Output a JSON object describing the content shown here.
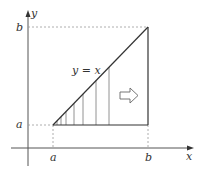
{
  "figure": {
    "colors": {
      "line": "#333333",
      "axis": "#555555",
      "dashed": "#9a9a9a",
      "hatch": "#777777",
      "arrow": "#666666",
      "background": "#ffffff"
    },
    "axes": {
      "x_label": "x",
      "y_label": "y"
    },
    "ticks": {
      "x_a": "a",
      "x_b": "b",
      "y_a": "a",
      "y_b": "b"
    },
    "curve_label": "y = x",
    "region": {
      "description": "triangle bounded by y = x, y = a and x = b",
      "hatch_lines_x": [
        57,
        61,
        66,
        74,
        83,
        96,
        109
      ]
    },
    "direction_arrow": "right"
  }
}
